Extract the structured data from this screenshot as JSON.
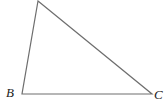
{
  "figure": {
    "type": "geometry-diagram",
    "shape": "triangle",
    "background_color": "#ffffff",
    "stroke_color": "#6e6e6e",
    "stroke_width": 1.2,
    "label_color": "#222222",
    "canvas": {
      "width": 166,
      "height": 105
    },
    "vertices": [
      {
        "id": "apex",
        "label": "",
        "x": 38,
        "y": 1,
        "labeled": false
      },
      {
        "id": "B",
        "label": "B",
        "x": 22,
        "y": 94,
        "labeled": true,
        "label_x": 6,
        "label_y": 86
      },
      {
        "id": "C",
        "label": "C",
        "x": 152,
        "y": 94,
        "labeled": true,
        "label_x": 154,
        "label_y": 88
      }
    ],
    "edges": [
      {
        "id": "apex-B",
        "from": "apex",
        "to": "B"
      },
      {
        "id": "apex-C",
        "from": "apex",
        "to": "C"
      },
      {
        "id": "B-C",
        "from": "B",
        "to": "C"
      }
    ],
    "polygon_points": "38,1 152,94 22,94",
    "labels": {
      "vertex_b": "B",
      "vertex_c": "C"
    }
  }
}
